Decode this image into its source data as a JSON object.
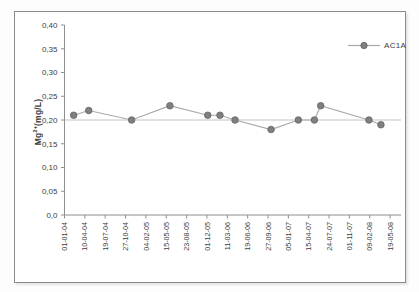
{
  "chart_data": {
    "type": "line",
    "title": "",
    "ylabel": "Mg2+(mg/L)",
    "ylabel_parts": {
      "base": "Mg",
      "sup": "2+",
      "rest": "(mg/L)"
    },
    "xlabel": "",
    "x_tick_labels": [
      "01-01-04",
      "10-04-04",
      "19-07-04",
      "27-10-04",
      "04-02-05",
      "15-05-05",
      "23-08-05",
      "01-12-05",
      "11-03-06",
      "19-06-06",
      "27-09-06",
      "05-01-07",
      "15-04-07",
      "24-07-07",
      "01-11-07",
      "09-02-08",
      "19-05-08"
    ],
    "y_tick_labels": [
      "0,0",
      "0,05",
      "0,10",
      "0,15",
      "0,20",
      "0,25",
      "0,30",
      "0,35",
      "0,40"
    ],
    "ylim": [
      0,
      0.4
    ],
    "y_tick_step": 0.05,
    "decimal_separator": "comma",
    "grid": false,
    "reference_line_y": 0.2,
    "legend_position": "top-right",
    "series": [
      {
        "name": "AC1A",
        "points": [
          {
            "x_tick_units": 0.45,
            "y": 0.21
          },
          {
            "x_tick_units": 1.19,
            "y": 0.22
          },
          {
            "x_tick_units": 3.3,
            "y": 0.2
          },
          {
            "x_tick_units": 5.18,
            "y": 0.23
          },
          {
            "x_tick_units": 7.04,
            "y": 0.21
          },
          {
            "x_tick_units": 7.64,
            "y": 0.21
          },
          {
            "x_tick_units": 8.38,
            "y": 0.2
          },
          {
            "x_tick_units": 10.15,
            "y": 0.18
          },
          {
            "x_tick_units": 11.49,
            "y": 0.2
          },
          {
            "x_tick_units": 12.28,
            "y": 0.2
          },
          {
            "x_tick_units": 12.59,
            "y": 0.23
          },
          {
            "x_tick_units": 14.96,
            "y": 0.2
          },
          {
            "x_tick_units": 15.55,
            "y": 0.19
          }
        ]
      }
    ],
    "colors": {
      "marker_fill": "#7f7f7f",
      "marker_stroke": "#666666",
      "series_line": "#a9a9a9",
      "reference_line": "#c4c4c4",
      "axis": "#8f8f8f",
      "text": "#3d3d3d",
      "frame_border": "#8a8a8a"
    }
  }
}
